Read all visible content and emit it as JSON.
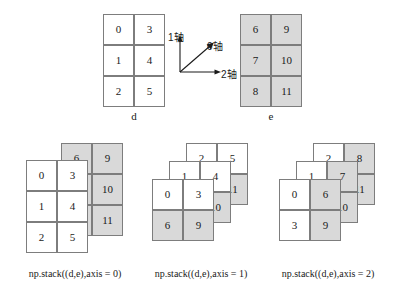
{
  "figure": {
    "type": "diagram",
    "topic": "numpy np.stack along axes 0, 1, 2",
    "colors": {
      "array_d_fill": "#ffffff",
      "array_e_fill": "#d9d9d9",
      "border": "#7d7d7d",
      "text": "#1a1a1a",
      "background": "#ffffff"
    }
  },
  "axis_indicator": {
    "axis0_label": "0轴",
    "axis1_label": "1轴",
    "axis2_label": "2轴"
  },
  "source_arrays": {
    "d": {
      "label": "d",
      "shape": [
        3,
        2
      ],
      "shaded": false,
      "rows": [
        [
          "0",
          "3"
        ],
        [
          "1",
          "4"
        ],
        [
          "2",
          "5"
        ]
      ]
    },
    "e": {
      "label": "e",
      "shape": [
        3,
        2
      ],
      "shaded": true,
      "rows": [
        [
          "6",
          "9"
        ],
        [
          "7",
          "10"
        ],
        [
          "8",
          "11"
        ]
      ]
    }
  },
  "panels": [
    {
      "caption": "np.stack((d,e),axis = 0)",
      "axis": 0,
      "result_shape": [
        2,
        3,
        2
      ],
      "layers": [
        {
          "source": "e",
          "shaded": true,
          "rows": [
            [
              "6",
              "9"
            ],
            [
              "7",
              "10"
            ],
            [
              "8",
              "11"
            ]
          ]
        },
        {
          "source": "d",
          "shaded": false,
          "rows": [
            [
              "0",
              "3"
            ],
            [
              "1",
              "4"
            ],
            [
              "2",
              "5"
            ]
          ]
        }
      ]
    },
    {
      "caption": "np.stack((d,e),axis = 1)",
      "axis": 1,
      "result_shape": [
        3,
        2,
        2
      ],
      "layers": [
        {
          "index": 2,
          "rows": [
            [
              "2",
              "5"
            ],
            [
              "8",
              "11"
            ]
          ]
        },
        {
          "index": 1,
          "rows": [
            [
              "1",
              "4"
            ],
            [
              "7",
              "10"
            ]
          ]
        },
        {
          "index": 0,
          "rows": [
            [
              "0",
              "3"
            ],
            [
              "6",
              "9"
            ]
          ]
        }
      ]
    },
    {
      "caption": "np.stack((d,e),axis = 2)",
      "axis": 2,
      "result_shape": [
        3,
        2,
        2
      ],
      "layers": [
        {
          "index": 2,
          "rows": [
            [
              "2",
              "8"
            ],
            [
              "5",
              "11"
            ]
          ]
        },
        {
          "index": 1,
          "rows": [
            [
              "1",
              "7"
            ],
            [
              "4",
              "10"
            ]
          ]
        },
        {
          "index": 0,
          "rows": [
            [
              "0",
              "6"
            ],
            [
              "3",
              "9"
            ]
          ]
        }
      ]
    }
  ]
}
